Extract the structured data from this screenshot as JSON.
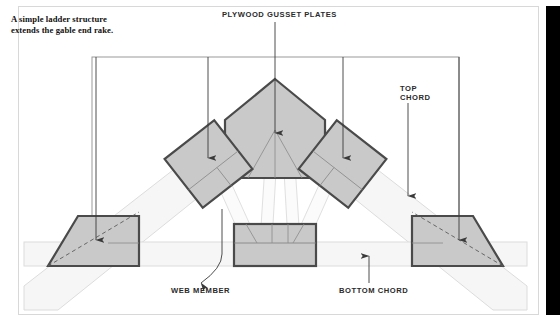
{
  "figure": {
    "caption": "A simple ladder structure extends the gable end rake.",
    "labels": {
      "gusset_plates": "PLYWOOD GUSSET PLATES",
      "top_chord": "TOP\nCHORD",
      "web_member": "WEB MEMBER",
      "bottom_chord": "BOTTOM CHORD"
    }
  },
  "colors": {
    "plate_fill": "#c9c9c9",
    "plate_stroke": "#4a4a4a",
    "member_fill": "#f4f4f4",
    "member_stroke": "#d9d9d9",
    "frame_stroke": "#9a9a9a",
    "leader_stroke": "#3a3a3a",
    "page_border": "#d8d8d8",
    "bleed_bar": "#000000",
    "text": "#222222"
  },
  "diagram": {
    "type": "gable-roof-truss-elevation",
    "frame": {
      "x": 92,
      "y": 57,
      "width": 367,
      "height": 207
    },
    "members": [
      {
        "name": "top-chord-left",
        "kind": "top-chord"
      },
      {
        "name": "top-chord-right",
        "kind": "top-chord"
      },
      {
        "name": "bottom-chord",
        "kind": "bottom-chord"
      },
      {
        "name": "web-left-outer",
        "kind": "web-member"
      },
      {
        "name": "web-left-inner",
        "kind": "web-member"
      },
      {
        "name": "web-right-inner",
        "kind": "web-member"
      },
      {
        "name": "web-right-outer",
        "kind": "web-member"
      }
    ],
    "gusset_plates": [
      {
        "name": "peak-gusset",
        "shape": "pentagon"
      },
      {
        "name": "left-upper-gusset",
        "shape": "rotated-square"
      },
      {
        "name": "right-upper-gusset",
        "shape": "rotated-square"
      },
      {
        "name": "center-bottom-gusset",
        "shape": "rectangle"
      },
      {
        "name": "left-heel-gusset",
        "shape": "trapezoid"
      },
      {
        "name": "right-heel-gusset",
        "shape": "trapezoid"
      }
    ],
    "leaders": [
      {
        "name": "leader-peak",
        "target": "peak-gusset",
        "direction": "down"
      },
      {
        "name": "leader-left-upper",
        "target": "left-upper-gusset",
        "direction": "down"
      },
      {
        "name": "leader-right-upper",
        "target": "right-upper-gusset",
        "direction": "down"
      },
      {
        "name": "leader-left-heel",
        "target": "left-heel-gusset",
        "direction": "down"
      },
      {
        "name": "leader-right-heel",
        "target": "right-heel-gusset",
        "direction": "down"
      },
      {
        "name": "leader-top-chord",
        "target": "top-chord-right",
        "direction": "down"
      },
      {
        "name": "leader-web-member",
        "target": "web-left-inner",
        "direction": "up"
      },
      {
        "name": "leader-bottom-chord",
        "target": "bottom-chord",
        "direction": "up"
      }
    ]
  }
}
